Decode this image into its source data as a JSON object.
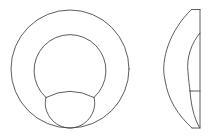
{
  "diagram": {
    "type": "technical-line-drawing",
    "line_color": "#4a4a4a",
    "background": "#ffffff",
    "views": [
      {
        "name": "front-view",
        "outer_circle": {
          "cx": 70,
          "cy": 69,
          "r": 59
        },
        "inner_circle": {
          "cx": 70,
          "cy": 68.5,
          "r": 36
        },
        "lower_segment": {
          "left_junction": [
            46,
            98
          ],
          "right_junction": [
            94,
            98
          ],
          "cap_top_y": 91,
          "bottom_y": 128
        }
      },
      {
        "name": "side-view",
        "right_edge_x": 200,
        "top_y": 9.5,
        "bottom_y": 128,
        "outer_arc_leftmost_x": 165,
        "inner_arc_leftmost_x": 188,
        "divider_y": 91
      }
    ]
  }
}
